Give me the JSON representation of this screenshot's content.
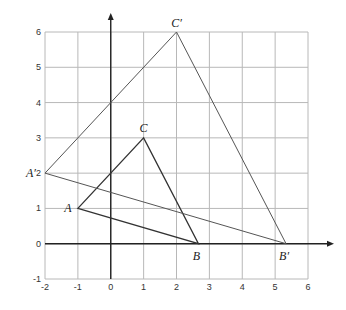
{
  "chart_data": {
    "type": "scatter",
    "title": "",
    "xlabel": "",
    "ylabel": "",
    "xlim": [
      -2,
      6
    ],
    "ylim": [
      -1,
      6
    ],
    "grid": true,
    "x_ticks": [
      "-2",
      "-1",
      "0",
      "1",
      "2",
      "3",
      "4",
      "5",
      "6"
    ],
    "y_ticks": [
      "-1",
      "0",
      "1",
      "2",
      "3",
      "4",
      "5",
      "6"
    ],
    "polygons": [
      {
        "name": "triangle ABC",
        "style": "original",
        "vertices": [
          {
            "label": "A",
            "x": -1,
            "y": 1
          },
          {
            "label": "B",
            "x": 2.667,
            "y": 0
          },
          {
            "label": "C",
            "x": 1,
            "y": 3
          }
        ]
      },
      {
        "name": "triangle A'B'C'",
        "style": "image",
        "vertices": [
          {
            "label": "A′",
            "x": -2,
            "y": 2
          },
          {
            "label": "B′",
            "x": 5.333,
            "y": 0
          },
          {
            "label": "C′",
            "x": 2,
            "y": 6
          }
        ]
      }
    ]
  }
}
